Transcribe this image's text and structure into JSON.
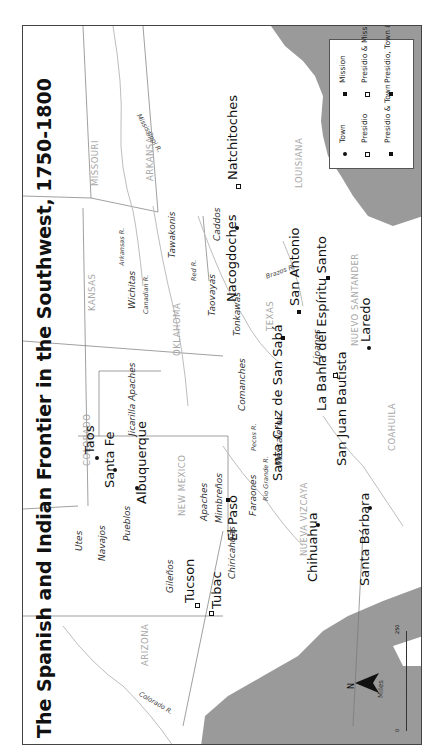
{
  "title": "The Spanish and Indian Frontier in the Southwest, 1750-1800",
  "orientation": "rotated 90° counter-clockwise (north points left)",
  "legend": {
    "items": [
      {
        "symbol": "filled-dot",
        "label": "Town"
      },
      {
        "symbol": "hollow-square",
        "label": "Presidio"
      },
      {
        "symbol": "asterisk",
        "label": "Presidio & Town"
      },
      {
        "symbol": "cross-filled-square",
        "label": "Mission"
      },
      {
        "symbol": "cross-hollow-square",
        "label": "Presidio & Mission"
      },
      {
        "symbol": "cross-asterisk",
        "label": "Presidio, Town & Mission"
      }
    ]
  },
  "states": {
    "missouri": "MISSOURI",
    "arkansas": "ARKANSAS",
    "louisiana": "LOUISIANA",
    "kansas": "KANSAS",
    "oklahoma": "OKLAHOMA",
    "texas": "TEXAS",
    "colorado": "COLORADO",
    "new_mexico": "NEW MEXICO",
    "arizona": "ARIZONA",
    "nuevo_santander": "NUEVO SANTANDER",
    "coahuila": "COAHUILA",
    "nueva_vizcaya": "NUEVA VIZCAYA"
  },
  "rivers": {
    "mississippi": "Mississippi R.",
    "arkansas": "Arkansas R.",
    "canadian": "Canadian R.",
    "red": "Red R.",
    "brazos": "Brazos R.",
    "pecos": "Pecos R.",
    "rio_grande": "Rio Grande R.",
    "colorado": "Colorado R."
  },
  "tribes": {
    "wichitas": "Wichitas",
    "tawakonis": "Tawakonis",
    "caddos": "Caddos",
    "taovayas": "Taovayas",
    "tonkawas": "Tonkawas",
    "comanches": "Comanches",
    "jicarilla": "Jicarilla Apaches",
    "lipanes": "Lipanes",
    "mescaleros": "Mescaleros",
    "faraones": "Faraones",
    "apaches": "Apaches",
    "mimbrenos": "Mimbreños",
    "utes": "Utes",
    "navajos": "Navajos",
    "pueblos": "Pueblos",
    "gilenos": "Gileños",
    "chiricahuas": "Chiricahuas"
  },
  "places": {
    "natchitoches": "Natchitoches",
    "nacogdoches": "Nacogdoches",
    "san_antonio": "San Antonio",
    "la_bahia": "La Bahía del Espíritu Santo",
    "laredo": "Laredo",
    "santa_cruz": "Santa Cruz de San Sabá",
    "san_juan_bautista": "San Juan Bautista",
    "taos": "Taos",
    "santa_fe": "Santa Fe",
    "albuquerque": "Albuquerque",
    "el_paso": "El Paso",
    "chihuahua": "Chihuahua",
    "santa_barbara": "Santa Bárbara",
    "tucson": "Tucson",
    "tubac": "Tubac"
  },
  "scale": {
    "unit": "Miles",
    "min": "0",
    "max": "250"
  },
  "compass": "N",
  "colors": {
    "water": "#9a9a9a",
    "land": "#ffffff",
    "border": "#555555",
    "state_text": "#a8a8a8"
  }
}
